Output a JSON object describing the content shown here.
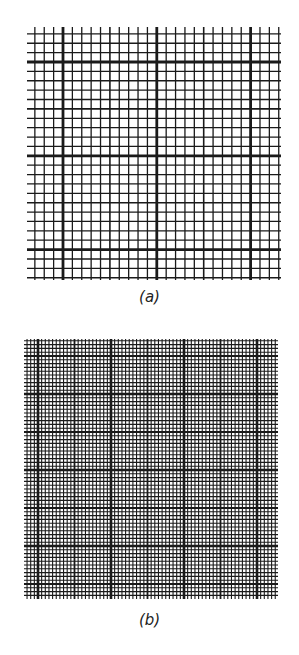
{
  "figure": {
    "panels": [
      {
        "id": "a",
        "caption": "(a)",
        "grid": {
          "x0": 29,
          "y0": 29,
          "x1": 279,
          "y1": 278,
          "minor_spacing_x": 9.38,
          "minor_spacing_y": 9.38,
          "origin_x": 63,
          "origin_y": 62,
          "medium_every": 5,
          "major_every": 10,
          "minor_width": 1.3,
          "medium_width": 1.6,
          "major_width": 2.8,
          "overhang": 2
        },
        "caption_y": 288
      },
      {
        "id": "b",
        "caption": "(b)",
        "grid": {
          "x0": 25,
          "y0": 340,
          "x1": 277,
          "y1": 598,
          "minor_spacing_x": 3.65,
          "minor_spacing_y": 3.8,
          "origin_x": 38,
          "origin_y": 470,
          "medium_every": 10,
          "major_every": 20,
          "minor_width": 1.1,
          "medium_width": 1.8,
          "major_width": 2.6,
          "overhang": 1
        },
        "caption_y": 611
      }
    ],
    "line_color": "#1a1a1a"
  }
}
